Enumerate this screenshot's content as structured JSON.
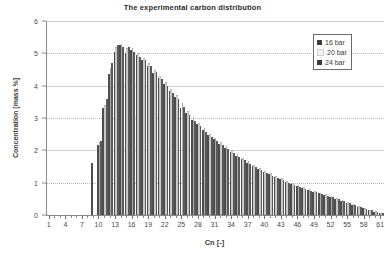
{
  "chart_data": {
    "type": "bar",
    "title": "The experimental carbon distribution",
    "xlabel": "Cn [-]",
    "ylabel": "Concentration [mass %]",
    "xlim": [
      1,
      61
    ],
    "ylim": [
      0,
      6
    ],
    "ytick_labels": [
      "0",
      "1",
      "2",
      "3",
      "4",
      "5",
      "6"
    ],
    "ytick_values": [
      0,
      1,
      2,
      3,
      4,
      5,
      6
    ],
    "xtick_labels": [
      "1",
      "4",
      "7",
      "10",
      "13",
      "16",
      "19",
      "22",
      "25",
      "28",
      "31",
      "34",
      "37",
      "40",
      "43",
      "46",
      "49",
      "52",
      "55",
      "58",
      "61"
    ],
    "xtick_values": [
      1,
      4,
      7,
      10,
      13,
      16,
      19,
      22,
      25,
      28,
      31,
      34,
      37,
      40,
      43,
      46,
      49,
      52,
      55,
      58,
      61
    ],
    "grid": true,
    "grid_axis": "y",
    "legend_position": "top-right",
    "categories": [
      1,
      2,
      3,
      4,
      5,
      6,
      7,
      8,
      9,
      10,
      11,
      12,
      13,
      14,
      15,
      16,
      17,
      18,
      19,
      20,
      21,
      22,
      23,
      24,
      25,
      26,
      27,
      28,
      29,
      30,
      31,
      32,
      33,
      34,
      35,
      36,
      37,
      38,
      39,
      40,
      41,
      42,
      43,
      44,
      45,
      46,
      47,
      48,
      49,
      50,
      51,
      52,
      53,
      54,
      55,
      56,
      57,
      58,
      59,
      60,
      61
    ],
    "series": [
      {
        "name": "16 bar",
        "color": "#4d4d4d",
        "values": [
          0,
          0,
          0,
          0,
          0,
          0,
          0,
          0,
          1.62,
          2.15,
          3.3,
          4.35,
          5.05,
          5.25,
          5.0,
          5.1,
          4.95,
          4.8,
          4.6,
          4.4,
          4.25,
          4.05,
          3.85,
          3.65,
          3.3,
          3.15,
          2.95,
          2.8,
          2.62,
          2.48,
          2.34,
          2.21,
          2.08,
          1.96,
          1.84,
          1.73,
          1.62,
          1.52,
          1.43,
          1.34,
          1.26,
          1.18,
          1.1,
          1.03,
          0.96,
          0.9,
          0.84,
          0.78,
          0.72,
          0.67,
          0.62,
          0.57,
          0.5,
          0.44,
          0.38,
          0.32,
          0.26,
          0.21,
          0.15,
          0.1,
          0.06
        ]
      },
      {
        "name": "20 bar",
        "color": "#e8e8e8",
        "values": [
          0,
          0,
          0,
          0,
          0,
          0,
          0,
          0,
          0,
          2.25,
          3.4,
          4.55,
          5.2,
          5.3,
          5.15,
          5.15,
          5.0,
          4.85,
          4.7,
          4.5,
          4.3,
          4.1,
          3.9,
          3.7,
          3.45,
          3.22,
          3.02,
          2.85,
          2.68,
          2.52,
          2.38,
          2.25,
          2.12,
          2.0,
          1.88,
          1.77,
          1.66,
          1.56,
          1.46,
          1.37,
          1.29,
          1.21,
          1.13,
          1.06,
          0.99,
          0.92,
          0.86,
          0.8,
          0.74,
          0.69,
          0.64,
          0.59,
          0.52,
          0.46,
          0.4,
          0.34,
          0.28,
          0.22,
          0.16,
          0.11,
          0.06
        ]
      },
      {
        "name": "24 bar",
        "color": "#5a5a5a",
        "values": [
          0,
          0,
          0,
          0,
          0,
          0,
          0,
          0,
          0,
          2.3,
          3.6,
          4.7,
          5.25,
          5.2,
          5.2,
          5.05,
          4.9,
          4.78,
          4.62,
          4.42,
          4.2,
          4.0,
          3.78,
          3.58,
          3.35,
          3.1,
          2.9,
          2.74,
          2.56,
          2.42,
          2.28,
          2.16,
          2.03,
          1.92,
          1.8,
          1.69,
          1.58,
          1.48,
          1.39,
          1.3,
          1.22,
          1.14,
          1.07,
          1.0,
          0.93,
          0.87,
          0.81,
          0.75,
          0.7,
          0.65,
          0.6,
          0.55,
          0.48,
          0.42,
          0.36,
          0.3,
          0.25,
          0.19,
          0.14,
          0.09,
          0.05
        ]
      }
    ]
  },
  "legend": {
    "items": [
      {
        "label": "16 bar",
        "color": "#3d3d3d"
      },
      {
        "label": "20 bar",
        "color": "#f2f2f2"
      },
      {
        "label": "24 bar",
        "color": "#3d3d3d"
      }
    ]
  },
  "colors": {
    "axis": "#8a8a8a",
    "grid": "#b9b9b9",
    "text": "#3a3a3a",
    "background": "#ffffff"
  }
}
